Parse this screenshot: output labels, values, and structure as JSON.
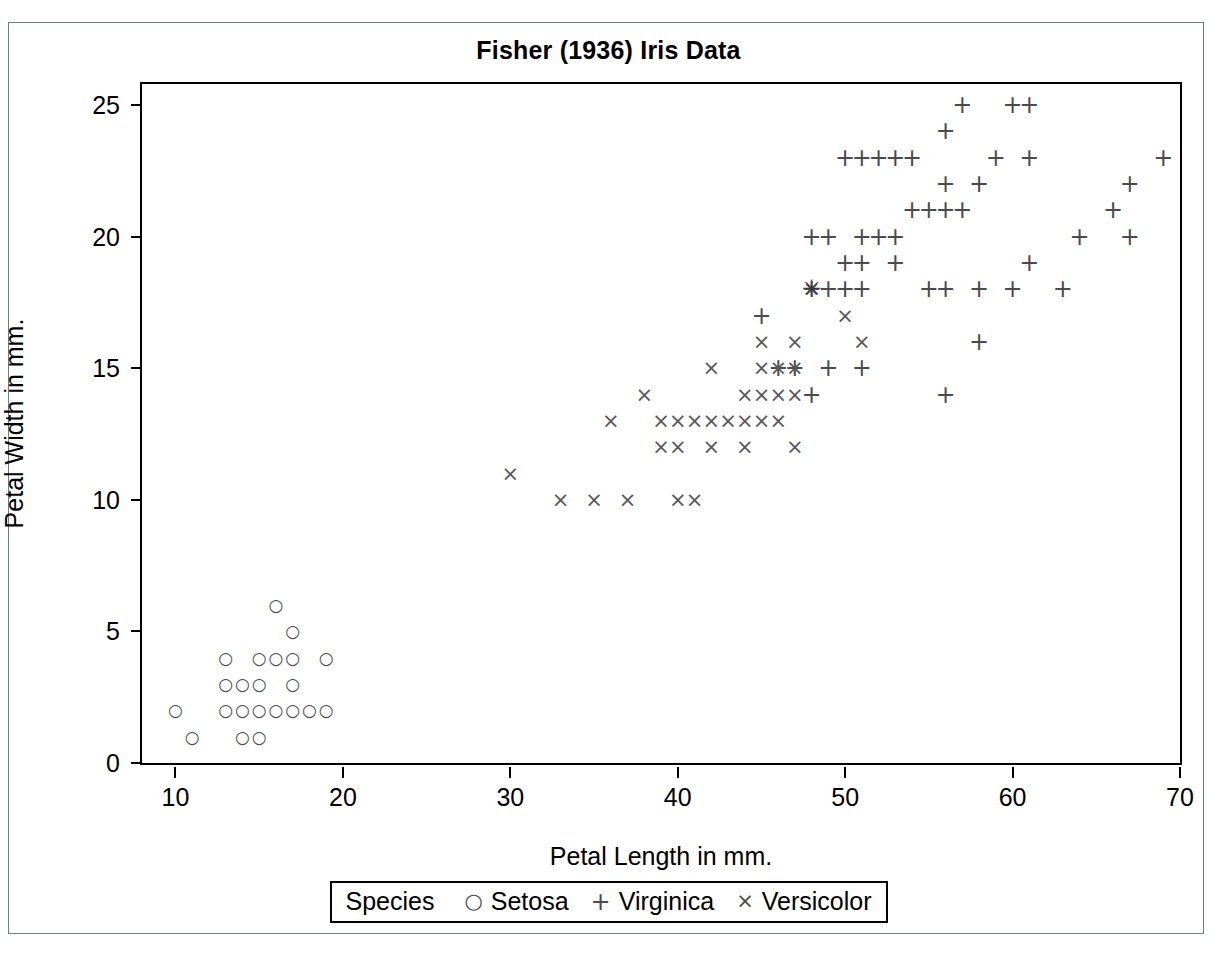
{
  "chart_data": {
    "type": "scatter",
    "title": "Fisher (1936) Iris Data",
    "xlabel": "Petal Length in mm.",
    "ylabel": "Petal Width in mm.",
    "xlim": [
      8,
      70
    ],
    "ylim": [
      0,
      25.8
    ],
    "xticks": [
      10,
      20,
      30,
      40,
      50,
      60,
      70
    ],
    "yticks": [
      0,
      5,
      10,
      15,
      20,
      25
    ],
    "grid": false,
    "legend_position": "bottom",
    "legend_title": "Species",
    "series": [
      {
        "name": "Setosa",
        "marker": "circle",
        "symbol": "○",
        "points": [
          [
            10,
            2
          ],
          [
            11,
            1
          ],
          [
            13,
            2
          ],
          [
            13,
            3
          ],
          [
            13,
            4
          ],
          [
            14,
            1
          ],
          [
            14,
            2
          ],
          [
            14,
            3
          ],
          [
            15,
            1
          ],
          [
            15,
            2
          ],
          [
            15,
            3
          ],
          [
            15,
            4
          ],
          [
            16,
            2
          ],
          [
            16,
            4
          ],
          [
            16,
            6
          ],
          [
            17,
            2
          ],
          [
            17,
            3
          ],
          [
            17,
            4
          ],
          [
            17,
            5
          ],
          [
            18,
            2
          ],
          [
            19,
            2
          ],
          [
            19,
            4
          ]
        ]
      },
      {
        "name": "Virginica",
        "marker": "plus",
        "symbol": "+",
        "points": [
          [
            45,
            17
          ],
          [
            48,
            18
          ],
          [
            49,
            18
          ],
          [
            50,
            18
          ],
          [
            50,
            23
          ],
          [
            51,
            18
          ],
          [
            51,
            15
          ],
          [
            51,
            19
          ],
          [
            51,
            20
          ],
          [
            51,
            23
          ],
          [
            52,
            20
          ],
          [
            52,
            23
          ],
          [
            53,
            19
          ],
          [
            53,
            20
          ],
          [
            53,
            23
          ],
          [
            54,
            21
          ],
          [
            54,
            23
          ],
          [
            55,
            21
          ],
          [
            55,
            18
          ],
          [
            56,
            14
          ],
          [
            56,
            18
          ],
          [
            56,
            21
          ],
          [
            56,
            22
          ],
          [
            56,
            24
          ],
          [
            57,
            21
          ],
          [
            57,
            25
          ],
          [
            58,
            16
          ],
          [
            58,
            18
          ],
          [
            58,
            22
          ],
          [
            59,
            23
          ],
          [
            60,
            18
          ],
          [
            60,
            25
          ],
          [
            61,
            19
          ],
          [
            61,
            23
          ],
          [
            61,
            25
          ],
          [
            63,
            18
          ],
          [
            64,
            20
          ],
          [
            66,
            21
          ],
          [
            67,
            20
          ],
          [
            67,
            22
          ],
          [
            69,
            23
          ],
          [
            48,
            14
          ],
          [
            49,
            20
          ],
          [
            50,
            19
          ],
          [
            46,
            15
          ],
          [
            47,
            15
          ],
          [
            48,
            20
          ],
          [
            49,
            15
          ]
        ]
      },
      {
        "name": "Versicolor",
        "marker": "x",
        "symbol": "×",
        "points": [
          [
            30,
            11
          ],
          [
            33,
            10
          ],
          [
            35,
            10
          ],
          [
            36,
            13
          ],
          [
            37,
            10
          ],
          [
            38,
            14
          ],
          [
            39,
            12
          ],
          [
            39,
            13
          ],
          [
            40,
            10
          ],
          [
            40,
            12
          ],
          [
            40,
            13
          ],
          [
            41,
            10
          ],
          [
            41,
            13
          ],
          [
            42,
            12
          ],
          [
            42,
            13
          ],
          [
            42,
            15
          ],
          [
            43,
            13
          ],
          [
            44,
            12
          ],
          [
            44,
            13
          ],
          [
            44,
            14
          ],
          [
            45,
            13
          ],
          [
            45,
            14
          ],
          [
            45,
            15
          ],
          [
            45,
            16
          ],
          [
            46,
            13
          ],
          [
            46,
            14
          ],
          [
            46,
            15
          ],
          [
            47,
            12
          ],
          [
            47,
            14
          ],
          [
            47,
            15
          ],
          [
            47,
            16
          ],
          [
            48,
            18
          ],
          [
            50,
            17
          ],
          [
            51,
            16
          ]
        ]
      }
    ],
    "overlap_points": [
      {
        "x": 48,
        "y": 18,
        "symbol": "✳",
        "note": "overlapping markers"
      }
    ]
  },
  "legend": {
    "title": "Species",
    "entries": [
      {
        "symbol": "○",
        "label": "Setosa"
      },
      {
        "symbol": "+",
        "label": "Virginica"
      },
      {
        "symbol": "×",
        "label": "Versicolor"
      }
    ]
  }
}
